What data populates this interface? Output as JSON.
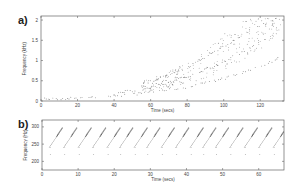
{
  "chart_data": [
    {
      "panel": "a)",
      "type": "scatter",
      "title": "",
      "xlabel": "Time (secs)",
      "ylabel": "Frequency (kHz)",
      "xlim": [
        0,
        133
      ],
      "ylim": [
        0,
        2.1
      ],
      "xticks": [
        0,
        20,
        40,
        60,
        80,
        100,
        120
      ],
      "yticks": [
        0,
        0.5,
        1,
        1.5,
        2
      ],
      "ytick_labels": [
        "0",
        "0.5",
        "1",
        "1.5",
        "2"
      ],
      "grid": false,
      "legend": null,
      "description": "Harmonic frequency tracks rising exponentially from ~0.05 kHz at t=0 to ~2 kHz at t≈130 s; multiple harmonics fan out from ~t=60 onward",
      "series": [
        {
          "name": "fundamental",
          "x": [
            2,
            20,
            40,
            60,
            80,
            100,
            120,
            130
          ],
          "y": [
            0.05,
            0.07,
            0.12,
            0.2,
            0.35,
            0.55,
            0.85,
            1.05
          ]
        },
        {
          "name": "harmonic-2",
          "x": [
            40,
            60,
            80,
            100,
            120,
            130
          ],
          "y": [
            0.18,
            0.33,
            0.6,
            0.95,
            1.45,
            1.75
          ]
        },
        {
          "name": "harmonic-3",
          "x": [
            60,
            80,
            100,
            120,
            130
          ],
          "y": [
            0.45,
            0.85,
            1.35,
            1.85,
            2.05
          ]
        }
      ]
    },
    {
      "panel": "b)",
      "type": "scatter",
      "title": "",
      "xlabel": "Time (secs)",
      "ylabel": "Frequency (Hz)",
      "xlim": [
        0,
        67
      ],
      "ylim": [
        175,
        320
      ],
      "xticks": [
        0,
        10,
        20,
        30,
        40,
        50,
        60
      ],
      "yticks": [
        200,
        250,
        300
      ],
      "grid": false,
      "legend": null,
      "description": "Repeating sawtooth frequency sweeps (~every 4 s) rising from ~240 Hz to ~300 Hz, with sparse points near 240 Hz and 220 Hz",
      "sweep_period_secs": 3.8,
      "sweep_starts": [
        2,
        6,
        10,
        14,
        18,
        21.5,
        25.5,
        29,
        33,
        37,
        41,
        44.5,
        48,
        52,
        56,
        60,
        64
      ],
      "sweep_low_hz": 240,
      "sweep_high_hz": 300,
      "baseline_points_hz": [
        240,
        220
      ]
    }
  ]
}
